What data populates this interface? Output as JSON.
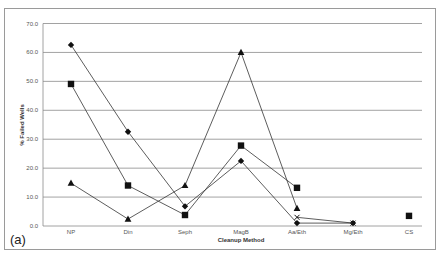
{
  "chart_data": {
    "type": "line",
    "title": "",
    "panel_label": "(a)",
    "xlabel": "Cleanup Method",
    "ylabel": "% Failed Wells",
    "ylim": [
      0,
      70
    ],
    "yticks": [
      "0.0",
      "10.0",
      "20.0",
      "30.0",
      "40.0",
      "50.0",
      "60.0",
      "70.0"
    ],
    "grid": true,
    "legend": "none",
    "categories": [
      "NP",
      "Din",
      "Seph",
      "MagB",
      "Aa/Eth",
      "Mg/Eth",
      "CS"
    ],
    "series": [
      {
        "name": "diamond-series",
        "marker": "diamond",
        "values": [
          62.6,
          32.6,
          6.8,
          22.5,
          1.0,
          1.0,
          null
        ]
      },
      {
        "name": "square-series",
        "marker": "square",
        "values": [
          49.1,
          14.0,
          3.8,
          27.8,
          13.2,
          null,
          3.5
        ]
      },
      {
        "name": "triangle-series",
        "marker": "triangle",
        "values": [
          14.8,
          2.4,
          14.0,
          60.0,
          6.1,
          null,
          null
        ]
      },
      {
        "name": "x-series",
        "marker": "x",
        "values": [
          null,
          null,
          null,
          null,
          3.0,
          1.0,
          null
        ]
      }
    ]
  }
}
